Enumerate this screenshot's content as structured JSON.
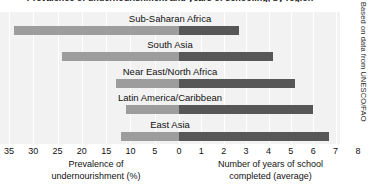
{
  "chart_data": {
    "type": "bar",
    "title": "Prevalence of undernourishment and years of schooling, by region",
    "subtitle": "",
    "orientation": "horizontal-diverging",
    "categories": [
      "Sub-Saharan Africa",
      "South Asia",
      "Near East/North Africa",
      "Latin America/Caribbean",
      "East Asia"
    ],
    "series": [
      {
        "name": "Prevalence of undernourishment (%)",
        "axis": "left",
        "color": "#9d9d9d",
        "values": [
          34,
          24,
          13,
          11,
          12
        ]
      },
      {
        "name": "Number of years of school completed (average)",
        "axis": "right",
        "color": "#575757",
        "values": [
          2.7,
          4.2,
          5.2,
          6.0,
          6.7
        ]
      }
    ],
    "left_axis": {
      "label_line1": "Prevalence of",
      "label_line2": "undernourishment (%)",
      "ticks": [
        35,
        30,
        25,
        20,
        15,
        10,
        5,
        0
      ],
      "tick_labels": [
        "35",
        "30",
        "25",
        "20",
        "15",
        "10",
        "5",
        "0"
      ],
      "range": [
        35,
        0
      ],
      "direction": "reversed"
    },
    "right_axis": {
      "label_line1": "Number of years of school",
      "label_line2": "completed (average)",
      "ticks": [
        0,
        1,
        2,
        3,
        4,
        5,
        6,
        7,
        8
      ],
      "tick_labels": [
        "0",
        "1",
        "2",
        "3",
        "4",
        "5",
        "6",
        "7",
        "8"
      ],
      "range": [
        0,
        8
      ],
      "direction": "normal"
    },
    "grid": true,
    "legend": "none",
    "plot_background": "#f2f2f2",
    "source": "Based on data from UNESCO/FAO"
  }
}
